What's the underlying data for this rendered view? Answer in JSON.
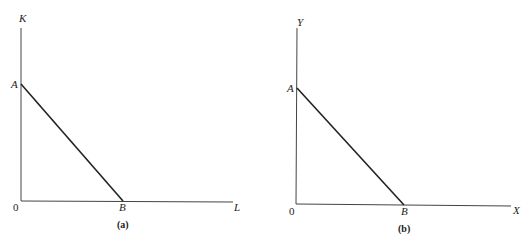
{
  "panels": [
    {
      "caption": "(a)",
      "y_axis_label": "K",
      "x_axis_label": "L",
      "origin_label": "0",
      "point_a_label": "A",
      "point_b_label": "B"
    },
    {
      "caption": "(b)",
      "y_axis_label": "Y",
      "x_axis_label": "X",
      "origin_label": "0",
      "point_a_label": "A",
      "point_b_label": "B"
    }
  ],
  "colors": {
    "line": "#222222",
    "axis": "#333333"
  }
}
